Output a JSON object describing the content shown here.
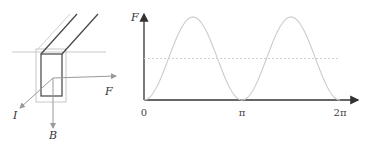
{
  "left_diagram": {
    "labels": {
      "force": "F",
      "current": "I",
      "field": "B"
    },
    "colors": {
      "conductor": "#444444",
      "guide": "#bbbbbb",
      "vector": "#888888"
    }
  },
  "chart_data": {
    "type": "line",
    "title": "",
    "ylabel": "F",
    "xlabel": "",
    "x_ticks": [
      {
        "value": 0,
        "label": "0"
      },
      {
        "value": 3.14159,
        "label": "π"
      },
      {
        "value": 6.28318,
        "label": "2π"
      }
    ],
    "xlim": [
      0,
      6.6
    ],
    "ylim": [
      0,
      1.05
    ],
    "series": [
      {
        "name": "F(t) = sin²(t)",
        "function": "sin^2",
        "color": "#cccccc",
        "x_range": [
          0,
          6.28318
        ]
      }
    ],
    "reference_lines": [
      {
        "name": "average",
        "y": 0.5,
        "style": "dashed",
        "color": "#cccccc"
      }
    ],
    "grid": false
  }
}
